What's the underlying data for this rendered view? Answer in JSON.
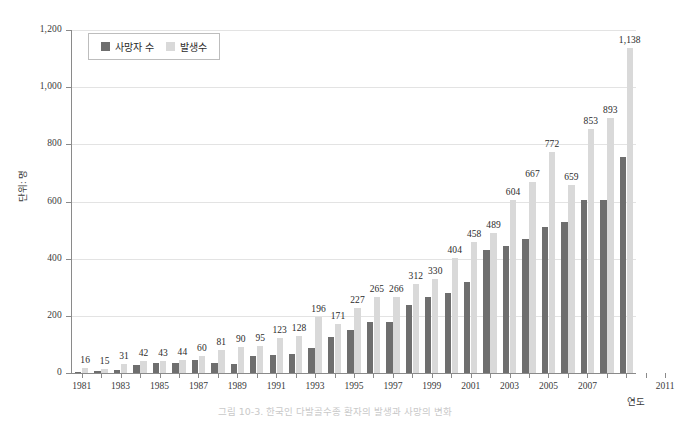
{
  "chart_data": {
    "type": "bar",
    "title": "",
    "caption": "그림 10-3. 한국인 다발골수종 환자의 발생과 사망의 변화",
    "xlabel": "연도",
    "ylabel": "단위: 명",
    "ylim": [
      0,
      1200
    ],
    "ytick_values": [
      0,
      200,
      400,
      600,
      800,
      1000,
      1200
    ],
    "ytick_labels": [
      "0",
      "200",
      "400",
      "600",
      "800",
      "1,000",
      "1,200"
    ],
    "grid": true,
    "legend_position": "top-left",
    "categories": [
      "1981",
      "1982",
      "1983",
      "1984",
      "1985",
      "1986",
      "1987",
      "1988",
      "1989",
      "1990",
      "1991",
      "1992",
      "1993",
      "1994",
      "1995",
      "1996",
      "1997",
      "1998",
      "1999",
      "2000",
      "2001",
      "2002",
      "2003",
      "2004",
      "2005",
      "2006",
      "2007",
      "2008",
      "2009",
      "2010",
      "2011"
    ],
    "xtick_labels": [
      "1981",
      "",
      "1983",
      "",
      "1985",
      "",
      "1987",
      "",
      "1989",
      "",
      "1991",
      "",
      "1993",
      "",
      "1995",
      "",
      "1997",
      "",
      "1999",
      "",
      "2001",
      "",
      "2003",
      "",
      "2005",
      "",
      "2007",
      "",
      "",
      "",
      "2011"
    ],
    "series": [
      {
        "name": "사망자 수",
        "color": "#6e6e6e",
        "values": [
          4,
          6,
          9,
          27,
          34,
          36,
          44,
          36,
          33,
          58,
          64,
          68,
          89,
          126,
          152,
          177,
          177,
          238,
          265,
          281,
          318,
          430,
          444,
          468,
          510,
          530,
          604,
          604,
          755,
          0,
          0
        ]
      },
      {
        "name": "발생수",
        "color": "#d9d9d9",
        "labelled_values": [
          16,
          15,
          31,
          42,
          43,
          44,
          60,
          81,
          90,
          95,
          123,
          128,
          196,
          171,
          227,
          265,
          266,
          312,
          330,
          404,
          458,
          489,
          604,
          667,
          772,
          659,
          853,
          893,
          1138
        ]
      }
    ],
    "bars": [
      {
        "year": "1981",
        "death": 4,
        "incidence": 16,
        "label": "16"
      },
      {
        "year": "1982",
        "death": 6,
        "incidence": 15,
        "label": "15"
      },
      {
        "year": "1983",
        "death": 9,
        "incidence": 31,
        "label": "31"
      },
      {
        "year": "1984",
        "death": 27,
        "incidence": 42,
        "label": "42"
      },
      {
        "year": "1985",
        "death": 34,
        "incidence": 43,
        "label": "43"
      },
      {
        "year": "1986",
        "death": 36,
        "incidence": 44,
        "label": "44"
      },
      {
        "year": "1987",
        "death": 44,
        "incidence": 60,
        "label": "60"
      },
      {
        "year": "1988",
        "death": 36,
        "incidence": 81,
        "label": "81"
      },
      {
        "year": "1989",
        "death": 33,
        "incidence": 90,
        "label": "90"
      },
      {
        "year": "1990",
        "death": 58,
        "incidence": 95,
        "label": "95"
      },
      {
        "year": "1991",
        "death": 64,
        "incidence": 123,
        "label": "123"
      },
      {
        "year": "1992",
        "death": 68,
        "incidence": 128,
        "label": "128"
      },
      {
        "year": "1993",
        "death": 89,
        "incidence": 196,
        "label": "196"
      },
      {
        "year": "1994",
        "death": 126,
        "incidence": 171,
        "label": "171"
      },
      {
        "year": "1995",
        "death": 152,
        "incidence": 227,
        "label": "227"
      },
      {
        "year": "1996",
        "death": 177,
        "incidence": 265,
        "label": "265"
      },
      {
        "year": "1997",
        "death": 177,
        "incidence": 266,
        "label": "266"
      },
      {
        "year": "1998",
        "death": 238,
        "incidence": 312,
        "label": "312"
      },
      {
        "year": "1999",
        "death": 265,
        "incidence": 330,
        "label": "330"
      },
      {
        "year": "2000",
        "death": 281,
        "incidence": 404,
        "label": "404"
      },
      {
        "year": "2001",
        "death": 318,
        "incidence": 458,
        "label": "458"
      },
      {
        "year": "2002",
        "death": 430,
        "incidence": 489,
        "label": "489"
      },
      {
        "year": "2003",
        "death": 444,
        "incidence": 604,
        "label": "604"
      },
      {
        "year": "2004",
        "death": 468,
        "incidence": 667,
        "label": "667"
      },
      {
        "year": "2005",
        "death": 510,
        "incidence": 772,
        "label": "772"
      },
      {
        "year": "2006",
        "death": 530,
        "incidence": 659,
        "label": "659"
      },
      {
        "year": "2007",
        "death": 604,
        "incidence": 853,
        "label": "853"
      },
      {
        "year": "2008",
        "death": 604,
        "incidence": 893,
        "label": "893"
      },
      {
        "year": "2009",
        "death": 755,
        "incidence": 1138,
        "label": "1,138"
      }
    ]
  }
}
